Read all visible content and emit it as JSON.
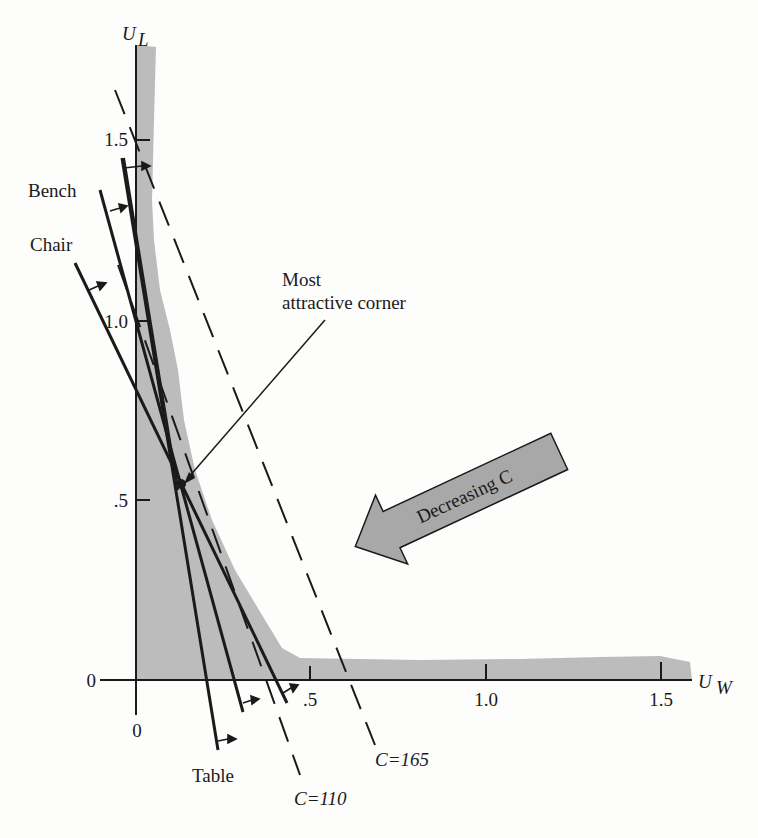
{
  "figure": {
    "y_axis_label": "U",
    "y_axis_sub": "L",
    "x_axis_label": "U",
    "x_axis_sub": "W",
    "y_ticks": [
      ".5",
      "1.0",
      "1.5"
    ],
    "y_zero": "0",
    "x_ticks": [
      ".5",
      "1.0",
      "1.5"
    ],
    "x_zero": "0",
    "constraint_labels": {
      "bench": "Bench",
      "chair": "Chair",
      "table": "Table"
    },
    "annotation": {
      "line1": "Most",
      "line2": "attractive corner"
    },
    "arrow_label": "Decreasing C",
    "cost_lines": {
      "c110": "C=110",
      "c165": "C=165"
    },
    "colors": {
      "ink": "#1a1a1a",
      "feasible_band": "#b9b9b9",
      "arrow_fill": "#a6a6a6",
      "background": "#fdfdfc"
    }
  }
}
